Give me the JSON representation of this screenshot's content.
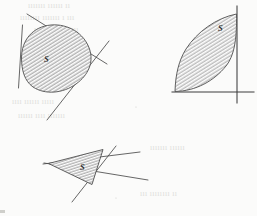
{
  "page": {
    "kind": "scanned-textbook-figure",
    "background_color": "#fbfbfa",
    "ink_color": "#4a4a4a",
    "bleed_text_color": "#d9d9d6",
    "width": 257,
    "height": 216
  },
  "figures": [
    {
      "id": "figure-1",
      "name": "convex-set-with-three-supporting-lines",
      "set_label": "S",
      "label_x": 44,
      "label_y": 62,
      "shape": "oval-blob",
      "supporting_lines": 3,
      "description": "Oval convex set S touched by three straight supporting lines"
    },
    {
      "id": "figure-2",
      "name": "convex-set-in-corner-of-two-axes",
      "set_label": "S",
      "label_x": 218,
      "label_y": 31,
      "shape": "lens-leaf",
      "supporting_lines": 2,
      "description": "Lens shaped convex set S tangent to a vertical line and a horizontal line"
    },
    {
      "id": "figure-3",
      "name": "triangular-convex-set-with-three-lines",
      "set_label": "S",
      "label_x": 80,
      "label_y": 170,
      "shape": "triangle",
      "supporting_lines": 3,
      "description": "Triangular convex set S bounded by three crossing straight lines"
    }
  ],
  "bleed_through_lines": [
    {
      "text": "ııııııı  ıııııı  ıı",
      "x": 28,
      "y": 8
    },
    {
      "text": "ıııııııı  ııııııı  ı ııı",
      "x": 20,
      "y": 20
    },
    {
      "text": "ııııı  ııııııı  ıııı",
      "x": 34,
      "y": 32
    },
    {
      "text": "ıııı  ıııııı ııııı",
      "x": 12,
      "y": 104
    },
    {
      "text": "ıııııı  ıııı ııııııı",
      "x": 18,
      "y": 118
    },
    {
      "text": "ııııııı  ıııııı",
      "x": 150,
      "y": 150
    },
    {
      "text": "ııı  ıııııııı ıı",
      "x": 140,
      "y": 196
    }
  ]
}
